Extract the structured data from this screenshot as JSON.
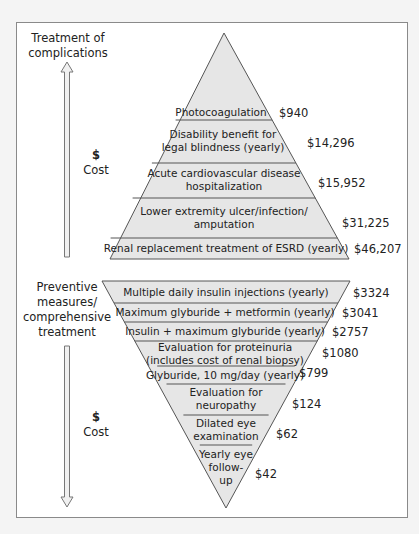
{
  "diagram": {
    "top_section": {
      "heading_line1": "Treatment of",
      "heading_line2": "complications",
      "axis_label_symbol": "$",
      "axis_label_text": "Cost",
      "arrow_direction": "up",
      "rows": [
        {
          "label_line1": "Photocoagulation",
          "label_line2": "",
          "cost": "$940"
        },
        {
          "label_line1": "Disability benefit for",
          "label_line2": "legal blindness (yearly)",
          "cost": "$14,296"
        },
        {
          "label_line1": "Acute cardiovascular disease",
          "label_line2": "hospitalization",
          "cost": "$15,952"
        },
        {
          "label_line1": "Lower extremity ulcer/infection/",
          "label_line2": "amputation",
          "cost": "$31,225"
        },
        {
          "label_line1": "Renal replacement treatment of ESRD (yearly)",
          "label_line2": "",
          "cost": "$46,207"
        }
      ]
    },
    "bottom_section": {
      "heading_line1": "Preventive",
      "heading_line2": "measures/",
      "heading_line3": "comprehensive",
      "heading_line4": "treatment",
      "axis_label_symbol": "$",
      "axis_label_text": "Cost",
      "arrow_direction": "down",
      "rows": [
        {
          "label_line1": "Multiple daily insulin injections (yearly)",
          "label_line2": "",
          "cost": "$3324"
        },
        {
          "label_line1": "Maximum glyburide + metformin (yearly)",
          "label_line2": "",
          "cost": "$3041"
        },
        {
          "label_line1": "Insulin + maximum glyburide (yearly)",
          "label_line2": "",
          "cost": "$2757"
        },
        {
          "label_line1": "Evaluation for proteinuria",
          "label_line2": "(includes cost of renal biopsy)",
          "cost": "$1080"
        },
        {
          "label_line1": "Glyburide, 10 mg/day (yearly)",
          "label_line2": "",
          "cost": "$799"
        },
        {
          "label_line1": "Evaluation for",
          "label_line2": "neuropathy",
          "cost": "$124"
        },
        {
          "label_line1": "Dilated eye",
          "label_line2": "examination",
          "cost": "$62"
        },
        {
          "label_line1": "Yearly eye",
          "label_line2": "follow-",
          "label_line3": "up",
          "cost": "$42"
        }
      ]
    },
    "colors": {
      "fill": "#e6e6e6",
      "stroke": "#555555",
      "arrow_fill": "#f0f0f0",
      "arrow_stroke": "#777777"
    }
  }
}
